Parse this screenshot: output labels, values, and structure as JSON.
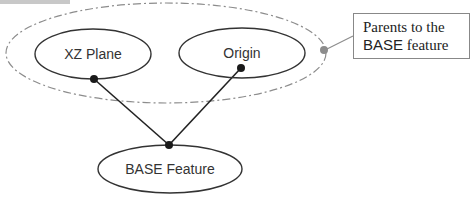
{
  "diagram": {
    "nodes": [
      {
        "id": "xz_plane",
        "label": "XZ Plane"
      },
      {
        "id": "origin",
        "label": "Origin"
      },
      {
        "id": "base_feature",
        "label": "BASE Feature"
      }
    ],
    "edges": [
      {
        "from": "xz_plane",
        "to": "base_feature"
      },
      {
        "from": "origin",
        "to": "base_feature"
      }
    ],
    "group": {
      "label": "parents-group",
      "members": [
        "xz_plane",
        "origin"
      ]
    },
    "callout": {
      "line1": "Parents to the",
      "line2_a": "BASE",
      "line2_b": " feature"
    },
    "colors": {
      "node_stroke": "#333333",
      "edge": "#222222",
      "group_stroke": "#8c8c8c",
      "connector_dot": "#8c8c8c"
    }
  }
}
